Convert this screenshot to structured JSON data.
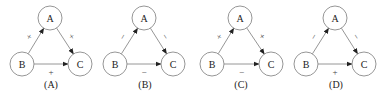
{
  "diagrams": [
    {
      "caption": "(A)",
      "nodes": {
        "A": "A",
        "B": "B",
        "C": "C"
      },
      "edges": [
        {
          "from": "B",
          "to": "A",
          "sign": "+"
        },
        {
          "from": "A",
          "to": "C",
          "sign": "+"
        },
        {
          "from": "B",
          "to": "C",
          "sign": "+"
        }
      ]
    },
    {
      "caption": "(B)",
      "nodes": {
        "A": "A",
        "B": "B",
        "C": "C"
      },
      "edges": [
        {
          "from": "B",
          "to": "A",
          "sign": "−"
        },
        {
          "from": "A",
          "to": "C",
          "sign": "−"
        },
        {
          "from": "B",
          "to": "C",
          "sign": "−"
        }
      ]
    },
    {
      "caption": "(C)",
      "nodes": {
        "A": "A",
        "B": "B",
        "C": "C"
      },
      "edges": [
        {
          "from": "B",
          "to": "A",
          "sign": "+"
        },
        {
          "from": "A",
          "to": "C",
          "sign": "+"
        },
        {
          "from": "B",
          "to": "C",
          "sign": "−"
        }
      ]
    },
    {
      "caption": "(D)",
      "nodes": {
        "A": "A",
        "B": "B",
        "C": "C"
      },
      "edges": [
        {
          "from": "B",
          "to": "A",
          "sign": "−"
        },
        {
          "from": "A",
          "to": "C",
          "sign": "−"
        },
        {
          "from": "B",
          "to": "C",
          "sign": "+"
        }
      ]
    }
  ]
}
